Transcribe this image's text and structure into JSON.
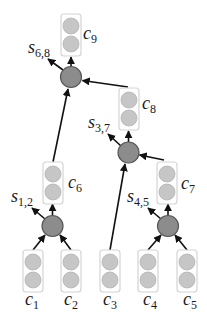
{
  "diagram": {
    "colors": {
      "merge_node_fill": "#8c8c8c",
      "merge_node_stroke": "#575757",
      "vector_dot_fill": "#c6c6c6",
      "box_stroke": "#d4d4d4",
      "edge": "#111111"
    },
    "leaf_nodes": [
      {
        "symbol": "c",
        "sub": "1"
      },
      {
        "symbol": "c",
        "sub": "2"
      },
      {
        "symbol": "c",
        "sub": "3"
      },
      {
        "symbol": "c",
        "sub": "4"
      },
      {
        "symbol": "c",
        "sub": "5"
      }
    ],
    "composed_nodes": [
      {
        "symbol": "c",
        "sub": "6"
      },
      {
        "symbol": "c",
        "sub": "7"
      },
      {
        "symbol": "c",
        "sub": "8"
      },
      {
        "symbol": "c",
        "sub": "9"
      }
    ],
    "scores": [
      {
        "symbol": "s",
        "sub": "1,2"
      },
      {
        "symbol": "s",
        "sub": "4,5"
      },
      {
        "symbol": "s",
        "sub": "3,7"
      },
      {
        "symbol": "s",
        "sub": "6,8"
      }
    ]
  }
}
